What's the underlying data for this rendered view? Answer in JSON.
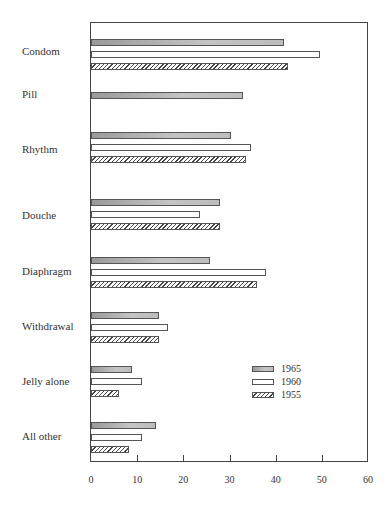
{
  "chart_data": {
    "type": "bar",
    "orientation": "horizontal",
    "title": "",
    "xlabel": "",
    "ylabel": "",
    "xlim": [
      0,
      60
    ],
    "x_ticks": [
      "0",
      "10",
      "20",
      "30",
      "40",
      "50",
      "60"
    ],
    "grid": false,
    "legend_position": "lower right (inside plot)",
    "categories": [
      "Condom",
      "Pill",
      "Rhythm",
      "Douche",
      "Diaphragm",
      "Withdrawal",
      "Jelly alone",
      "All other"
    ],
    "series": [
      {
        "name": "1965",
        "style": "gray shaded",
        "values": [
          41.7,
          32.9,
          30.4,
          27.9,
          25.8,
          14.8,
          8.9,
          14.0
        ]
      },
      {
        "name": "1960",
        "style": "white",
        "values": [
          49.7,
          null,
          34.6,
          23.7,
          37.8,
          16.7,
          11.0,
          11.1
        ]
      },
      {
        "name": "1955",
        "style": "hatched",
        "values": [
          42.7,
          null,
          33.5,
          27.9,
          36.0,
          14.8,
          6.0,
          8.2
        ]
      }
    ]
  },
  "labels": {
    "condom": "Condom",
    "pill": "Pill",
    "rhythm": "Rhythm",
    "douche": "Douche",
    "diaphragm": "Diaphragm",
    "withdrawal": "Withdrawal",
    "jelly": "Jelly alone",
    "other": "All other"
  },
  "ticks": [
    "0",
    "10",
    "20",
    "30",
    "40",
    "50",
    "60"
  ],
  "legend": [
    "1965",
    "1960",
    "1955"
  ]
}
